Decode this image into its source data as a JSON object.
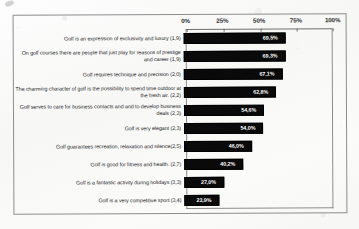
{
  "chart_data": {
    "type": "bar",
    "orientation": "horizontal",
    "title": "",
    "xlabel": "",
    "ylabel": "",
    "xlim": [
      0,
      100
    ],
    "xticks": [
      "0%",
      "25%",
      "50%",
      "75%",
      "100%"
    ],
    "xtick_values": [
      0,
      25,
      50,
      75,
      100
    ],
    "grid": false,
    "legend": false,
    "value_suffix": "%",
    "categories": [
      "Golf is an expression of exclusivity and luxury (1,9)",
      "On golf courses there are people that just play for reasons of prestige and career (1,9)",
      "Golf requires technique and precision (2,0)",
      "The charming character of golf is the possibility to spend time outdoor at the fresh air. (2,2)",
      "Golf serves to care for business contacts and and to develop business deals (2,3)",
      "Golf is very elegant (2,3)",
      "Golf guarantees recreation, relaxation and silence(2,5)",
      "Golf is good for fitness and health. (2,7)",
      "Golf is a fantastic activity during holidays (3,3)",
      "Golf is a very competitive sport (3,4)"
    ],
    "values": [
      69.5,
      69.3,
      67.1,
      62.8,
      54.6,
      54.0,
      46.0,
      40.2,
      27.0,
      23.9
    ],
    "value_labels": [
      "69,5%",
      "69,3%",
      "67,1%",
      "62,8%",
      "54,6%",
      "54,0%",
      "46,0%",
      "40,2%",
      "27,0%",
      "23,9%"
    ],
    "bar_color": "#0a0a0a",
    "value_label_color": "#ffffff",
    "frame_color": "#8d8d8d"
  }
}
